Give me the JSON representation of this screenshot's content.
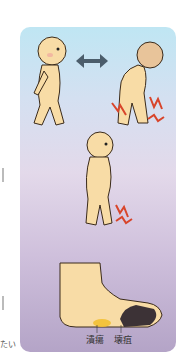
{
  "figure": {
    "panels": [
      {
        "id": "walking-vs-pain",
        "description": "Person walking normally, double arrow, person stopped with leg pain"
      },
      {
        "id": "rest-pain",
        "description": "Person standing with leg pain"
      },
      {
        "id": "foot-lesions",
        "description": "Foot with ulcer and gangrene"
      }
    ],
    "labels": {
      "ulcer": "潰瘍",
      "gangrene": "壊疽"
    },
    "edge_text": {
      "bottom_fragment": "たい"
    },
    "colors": {
      "card_top": "#bfe6f3",
      "card_bottom": "#b4a4c7",
      "skin": "#f8dca6",
      "arrow": "#4b5d6b",
      "pain_bolt": "#d8452b",
      "ulcer": "#f2c033",
      "gangrene": "#3c3236"
    }
  }
}
